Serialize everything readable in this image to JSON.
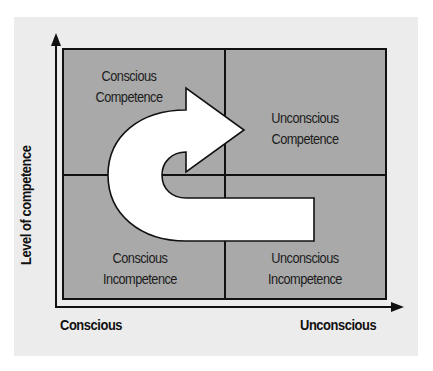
{
  "diagram": {
    "title": "",
    "colors": {
      "page_background": "#ffffff",
      "panel_background": "#ececec",
      "quadrant_fill": "#a9a9a9",
      "lines": "#111111",
      "arrow_fill": "#ffffff",
      "text": "#1c1c1c"
    },
    "axes": {
      "y_label": "Level of competence",
      "x_left_label": "Conscious",
      "x_right_label": "Unconscious"
    },
    "quadrants": {
      "top_left": {
        "line1": "Conscious",
        "line2": "Competence"
      },
      "top_right": {
        "line1": "Unconscious",
        "line2": "Competence"
      },
      "bottom_left": {
        "line1": "Conscious",
        "line2": "Incompetence"
      },
      "bottom_right": {
        "line1": "Unconscious",
        "line2": "Incompetence"
      }
    },
    "arrow": {
      "type": "u-turn-arrow",
      "from": "bottom_right",
      "via": "bottom_left / top_left",
      "to": "top_right"
    }
  }
}
